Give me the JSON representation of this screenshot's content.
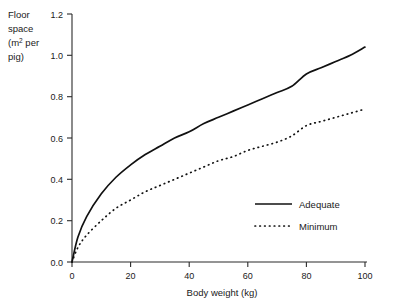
{
  "chart_data": {
    "type": "line",
    "title": "",
    "xlabel": "Body weight (kg)",
    "ylabel": "Floor space (m2 per pig)",
    "ylabel_lines": [
      "Floor",
      "space",
      "(m",
      "2",
      " per",
      "pig)"
    ],
    "ylabel_part1": "Floor",
    "ylabel_part2": "space",
    "ylabel_part3a": "(m",
    "ylabel_part3sup": "2",
    "ylabel_part3b": " per",
    "ylabel_part4": "pig)",
    "xlim": [
      0,
      100
    ],
    "ylim": [
      0.0,
      1.2
    ],
    "xticks": [
      0,
      20,
      40,
      60,
      80,
      100
    ],
    "xtick_labels": [
      "0",
      "20",
      "40",
      "60",
      "80",
      "100"
    ],
    "yticks": [
      0.0,
      0.2,
      0.4,
      0.6,
      0.8,
      1.0,
      1.2
    ],
    "ytick_labels": [
      "0.0",
      "0.2",
      "0.4",
      "0.6",
      "0.8",
      "1.0",
      "1.2"
    ],
    "grid": false,
    "legend_position": "lower right",
    "x": [
      0,
      2,
      5,
      10,
      15,
      20,
      25,
      30,
      35,
      40,
      45,
      50,
      55,
      60,
      65,
      70,
      75,
      80,
      85,
      90,
      95,
      100
    ],
    "series": [
      {
        "name": "Adequate",
        "style": "solid",
        "color": "#111111",
        "values": [
          0.0,
          0.12,
          0.22,
          0.33,
          0.41,
          0.47,
          0.52,
          0.56,
          0.6,
          0.63,
          0.67,
          0.7,
          0.73,
          0.76,
          0.79,
          0.82,
          0.85,
          0.91,
          0.94,
          0.97,
          1.0,
          1.04
        ]
      },
      {
        "name": "Minimum",
        "style": "dotted",
        "color": "#111111",
        "values": [
          0.0,
          0.07,
          0.13,
          0.2,
          0.26,
          0.3,
          0.34,
          0.37,
          0.4,
          0.43,
          0.46,
          0.49,
          0.51,
          0.54,
          0.56,
          0.58,
          0.61,
          0.66,
          0.68,
          0.7,
          0.72,
          0.74
        ]
      }
    ]
  },
  "legend": {
    "items": [
      {
        "label": "Adequate",
        "style": "solid"
      },
      {
        "label": "Minimum",
        "style": "dotted"
      }
    ]
  }
}
